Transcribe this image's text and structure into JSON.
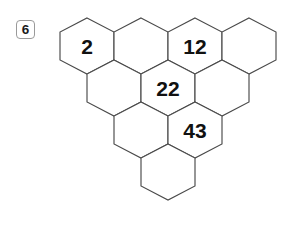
{
  "question": {
    "number": "6"
  },
  "puzzle": {
    "type": "hexagon-number-pyramid",
    "rows": [
      {
        "row_index": 0,
        "cells": [
          {
            "id": "r0c0",
            "value": "2"
          },
          {
            "id": "r0c1",
            "value": ""
          },
          {
            "id": "r0c2",
            "value": "12"
          },
          {
            "id": "r0c3",
            "value": ""
          }
        ]
      },
      {
        "row_index": 1,
        "cells": [
          {
            "id": "r1c0",
            "value": ""
          },
          {
            "id": "r1c1",
            "value": "22"
          },
          {
            "id": "r1c2",
            "value": ""
          }
        ]
      },
      {
        "row_index": 2,
        "cells": [
          {
            "id": "r2c0",
            "value": ""
          },
          {
            "id": "r2c1",
            "value": "43"
          }
        ]
      },
      {
        "row_index": 3,
        "cells": [
          {
            "id": "r3c0",
            "value": ""
          }
        ]
      }
    ],
    "filled_values": [
      "2",
      "12",
      "22",
      "43"
    ],
    "colors": {
      "hex_stroke": "#4a4a4a",
      "hex_fill": "#ffffff",
      "value_text": "#111111",
      "badge_border": "#9a9a9a",
      "badge_text": "#1a1a1a",
      "background": "#ffffff"
    },
    "geometry": {
      "hex_width": 54,
      "hex_height": 56,
      "origin_x": 60,
      "origin_y": 18,
      "row_step_y": 42,
      "row_offset_x": 27
    }
  }
}
